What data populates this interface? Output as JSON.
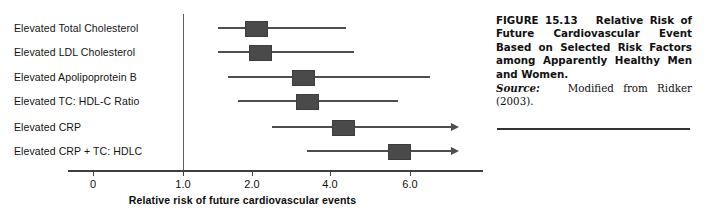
{
  "chart_data": {
    "type": "scatter",
    "title": "",
    "xlabel": "Relative risk of future cardiovascular events",
    "ylabel": "",
    "grid": false,
    "legend": null,
    "xlim": [
      0,
      7.2
    ],
    "xticks": [
      0,
      1.0,
      2.0,
      4.0,
      6.0
    ],
    "xtick_labels": [
      "0",
      "1.0",
      "2.0",
      "4.0",
      "6.0"
    ],
    "reference_line_x": 1.0,
    "categories": [
      "Elevated Total Cholesterol",
      "Elevated LDL Cholesterol",
      "Elevated Apolipoprotein B",
      "Elevated TC: HDL-C Ratio",
      "Elevated CRP",
      "Elevated CRP + TC: HDLC"
    ],
    "points": [
      {
        "label": "Elevated Total Cholesterol",
        "value": 2.1,
        "ci_low": 1.5,
        "ci_high": 4.4,
        "truncated_high": false
      },
      {
        "label": "Elevated LDL Cholesterol",
        "value": 2.2,
        "ci_low": 1.5,
        "ci_high": 4.6,
        "truncated_high": false
      },
      {
        "label": "Elevated Apolipoprotein B",
        "value": 3.3,
        "ci_low": 1.65,
        "ci_high": 6.5,
        "truncated_high": false
      },
      {
        "label": "Elevated TC: HDL-C Ratio",
        "value": 3.4,
        "ci_low": 1.8,
        "ci_high": 5.7,
        "truncated_high": false
      },
      {
        "label": "Elevated CRP",
        "value": 4.3,
        "ci_low": 2.5,
        "ci_high": 7.2,
        "truncated_high": true
      },
      {
        "label": "Elevated CRP + TC: HDLC",
        "value": 5.7,
        "ci_low": 3.4,
        "ci_high": 7.2,
        "truncated_high": true
      }
    ],
    "marker_color": "#4a4a4a",
    "line_color": "#4e4e4e"
  },
  "caption": {
    "figure_number": "FIGURE 15.13",
    "title": "Relative Risk of Future Cardiovascular Event Based on Selected Risk Factors among Apparently Healthy Men and Women.",
    "source_label": "Source:",
    "source_text": "Modified from Ridker (2003)."
  }
}
